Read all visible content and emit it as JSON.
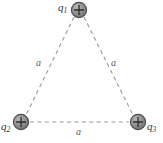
{
  "figure": {
    "type": "physics-diagram",
    "width": 163,
    "height": 143,
    "background_color": "#ffffff"
  },
  "colors": {
    "charge_fill": "#8a8a8a",
    "charge_stroke": "#4a4a4a",
    "charge_highlight": "#b5b5b5",
    "plus_sign": "#2b2b2b",
    "dashed_line": "#9a9a9a",
    "label_text": "#333333",
    "side_label_text": "#5a5a5a"
  },
  "charges": [
    {
      "id": "q1",
      "label": "q",
      "subscript": "1",
      "sign": "+",
      "position": {
        "x": 79,
        "y": 10
      },
      "radius": 8,
      "label_position": "left"
    },
    {
      "id": "q2",
      "label": "q",
      "subscript": "2",
      "sign": "+",
      "position": {
        "x": 21,
        "y": 122
      },
      "radius": 8,
      "label_position": "left"
    },
    {
      "id": "q3",
      "label": "q",
      "subscript": "3",
      "sign": "+",
      "position": {
        "x": 138,
        "y": 122
      },
      "radius": 8,
      "label_position": "right"
    }
  ],
  "sides": [
    {
      "id": "side-left",
      "label": "a",
      "from": "q1",
      "to": "q2",
      "style": "dashed",
      "label_position": {
        "x": 36,
        "y": 58
      }
    },
    {
      "id": "side-right",
      "label": "a",
      "from": "q1",
      "to": "q3",
      "style": "dashed",
      "label_position": {
        "x": 111,
        "y": 58
      }
    },
    {
      "id": "side-bottom",
      "label": "a",
      "from": "q2",
      "to": "q3",
      "style": "dashed",
      "label_position": {
        "x": 76,
        "y": 127
      }
    }
  ],
  "icons": {
    "plus": "+"
  }
}
